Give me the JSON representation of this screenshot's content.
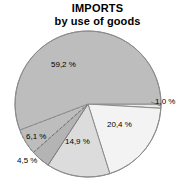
{
  "chart_data": {
    "type": "pie",
    "title": "IMPORTS",
    "subtitle": "by use of goods",
    "xlabel": "",
    "ylabel": "",
    "legend": "none",
    "grid": false,
    "total": 100.1,
    "decimal_separator": ",",
    "value_suffix": " %",
    "start_angle_deg": 0,
    "direction": "clockwise",
    "categories": [
      "1,0 %",
      "20,4 %",
      "14,9 %",
      "4,5 %",
      "6,1 %",
      "59,2 %"
    ],
    "values": [
      1.0,
      20.4,
      14.9,
      4.5,
      6.1,
      59.2
    ],
    "slices": [
      {
        "label": "1,0 %",
        "value": 1.0,
        "color": "#e8e8e8",
        "stroke": "#7a7a7a",
        "stroke_style": "solid",
        "label_placement": "outside-right",
        "leader_line": true,
        "label_x": 155,
        "label_y": 97
      },
      {
        "label": "20,4 %",
        "value": 20.4,
        "color": "#f3f3f3",
        "stroke": "#8c8c8c",
        "stroke_style": "solid",
        "label_placement": "inside",
        "leader_line": false,
        "label_x": 107,
        "label_y": 120
      },
      {
        "label": "14,9 %",
        "value": 14.9,
        "color": "#dcdcdc",
        "stroke": "#8c8c8c",
        "stroke_style": "solid",
        "label_placement": "inside",
        "leader_line": false,
        "label_x": 65,
        "label_y": 137
      },
      {
        "label": "4,5 %",
        "value": 4.5,
        "color": "#b4b4b4",
        "stroke": "#7a7a7a",
        "stroke_style": "solid",
        "label_placement": "outside-left",
        "leader_line": false,
        "label_x": 17,
        "label_y": 156
      },
      {
        "label": "6,1 %",
        "value": 6.1,
        "color": "#bdbdbd",
        "stroke": "#6e6e6e",
        "stroke_style": "dashed",
        "label_placement": "inside-left",
        "leader_line": false,
        "label_x": 26,
        "label_y": 132
      },
      {
        "label": "59,2 %",
        "value": 59.2,
        "color": "#bdbdbd",
        "stroke": "#8c8c8c",
        "stroke_style": "solid",
        "label_placement": "inside",
        "leader_line": false,
        "label_x": 51,
        "label_y": 60
      }
    ],
    "geometry": {
      "center_x": 88,
      "center_y": 104,
      "radius": 73,
      "outline_color": "#8c8c8c"
    },
    "background": "#ffffff",
    "text_color": "#000000"
  }
}
